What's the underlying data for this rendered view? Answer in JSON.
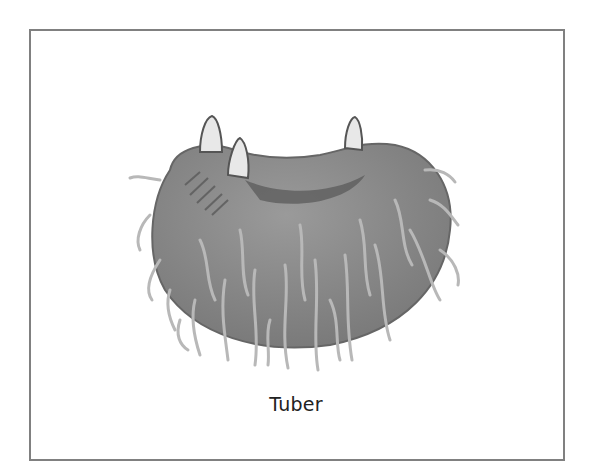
{
  "figure": {
    "caption": "Tuber",
    "colors": {
      "frame_border": "#808080",
      "body": "#8c8c8c",
      "body_dark": "#6a6a6a",
      "roots": "#b4b4b4",
      "sprouts": "#e6e6e6"
    }
  }
}
